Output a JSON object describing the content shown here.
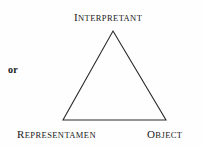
{
  "figure": {
    "type": "semiotic-triangle-diagram",
    "background_color": "#fefefe",
    "stroke_color": "#2b2b2b",
    "text_color": "#1a1a1a",
    "side_note": "or",
    "vertices": {
      "apex": {
        "x": 113,
        "y": 31
      },
      "bottom_left": {
        "x": 63,
        "y": 120
      },
      "bottom_right": {
        "x": 166,
        "y": 120
      }
    },
    "labels": {
      "top": {
        "text": "INTERPRETANT",
        "initial": "I",
        "rest": "NTERPRETANT"
      },
      "bottom_left": {
        "text": "REPRESENTAMEN",
        "initial": "R",
        "rest": "EPRESENTAMEN"
      },
      "bottom_right": {
        "text": "OBJECT",
        "initial": "O",
        "rest": "BJECT"
      }
    }
  }
}
